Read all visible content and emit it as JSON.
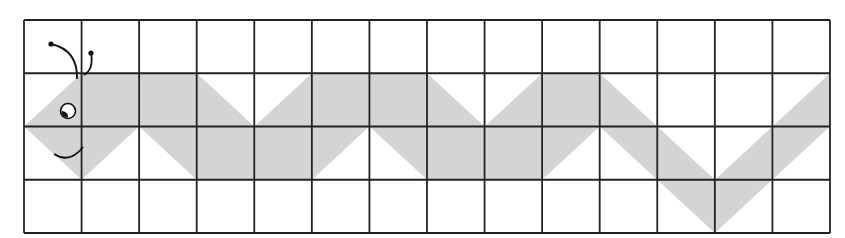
{
  "figure": {
    "title": "Caterpillar on a grid",
    "grid": {
      "columns": 14,
      "rows": 4,
      "origin_px": [
        24,
        20
      ],
      "cell_width_px": 57.57,
      "cell_height_px": 53.25,
      "line_color": "#222222",
      "line_width_px": 1.8
    },
    "shape": {
      "name": "caterpillar-body",
      "fill": "#d4d4d4",
      "vertices_grid": [
        [
          0,
          2
        ],
        [
          1,
          1
        ],
        [
          3,
          1
        ],
        [
          4,
          2
        ],
        [
          5,
          1
        ],
        [
          7,
          1
        ],
        [
          8,
          2
        ],
        [
          9,
          1
        ],
        [
          10,
          1
        ],
        [
          12,
          3
        ],
        [
          14,
          1
        ],
        [
          14,
          2
        ],
        [
          12,
          4
        ],
        [
          10,
          2
        ],
        [
          9,
          3
        ],
        [
          7,
          3
        ],
        [
          6,
          2
        ],
        [
          5,
          3
        ],
        [
          3,
          3
        ],
        [
          2,
          2
        ],
        [
          1,
          3
        ]
      ]
    },
    "face": {
      "eye": {
        "center_px": [
          68,
          111
        ],
        "radius_px": 7.5,
        "outline": "#111111",
        "fill": "#ffffff",
        "pupil": "#111111"
      },
      "mouth": {
        "color": "#111111"
      },
      "antennae": [
        {
          "tip_px": [
            51,
            44
          ],
          "base_px": [
            77,
            75
          ]
        },
        {
          "tip_px": [
            91,
            53
          ],
          "base_px": [
            84,
            75
          ]
        }
      ]
    }
  }
}
